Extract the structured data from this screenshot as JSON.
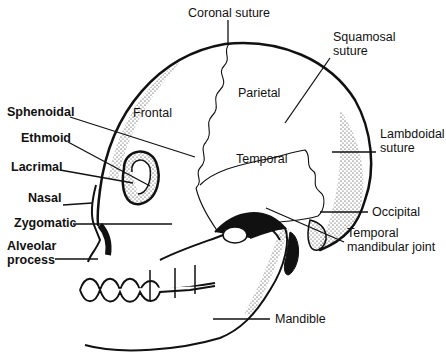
{
  "diagram": {
    "labels": {
      "coronal_suture": "Coronal suture",
      "squamosal_suture": "Squamosal\nsuture",
      "frontal": "Frontal",
      "parietal": "Parietal",
      "temporal": "Temporal",
      "lambdoidal_suture": "Lambdoidal\nsuture",
      "sphenoidal": "Sphenoidal",
      "ethmoid": "Ethmoid",
      "lacrimal": "Lacrimal",
      "nasal": "Nasal",
      "zygomatic": "Zygomatic",
      "alveolar_process": "Alveolar\nprocess",
      "occipital": "Occipital",
      "temporal_mandibular_joint": "Temporal\nmandibular joint",
      "mandible": "Mandible"
    },
    "colors": {
      "ink": "#111111",
      "background": "#ffffff"
    }
  }
}
